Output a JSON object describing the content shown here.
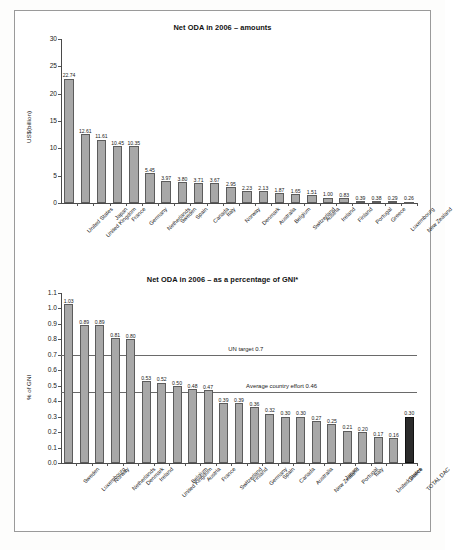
{
  "chart_data": [
    {
      "type": "bar",
      "title": "Net ODA in 2006 – amounts",
      "xlabel": "",
      "ylabel": "US$(billion)",
      "ylim": [
        0,
        30
      ],
      "yticks": [
        "0",
        "5",
        "10",
        "15",
        "20",
        "25",
        "30"
      ],
      "grid": false,
      "legend": "none",
      "categories": [
        "United States",
        "United Kingdom",
        "Japan",
        "France",
        "Germany",
        "Netherlands",
        "Sweden",
        "Spain",
        "Canada",
        "Italy",
        "Norway",
        "Denmark",
        "Australia",
        "Belgium",
        "Switzerland",
        "Austria",
        "Ireland",
        "Finland",
        "Portugal",
        "Greece",
        "Luxembourg",
        "New Zealand"
      ],
      "values": [
        22.74,
        12.61,
        11.61,
        10.45,
        10.35,
        5.45,
        3.97,
        3.8,
        3.71,
        3.67,
        2.95,
        2.23,
        2.13,
        1.87,
        1.65,
        1.51,
        1.0,
        0.83,
        0.39,
        0.38,
        0.29,
        0.26
      ],
      "value_labels": [
        "22.74",
        "12.61",
        "11.61",
        "10.45",
        "10.35",
        "5.45",
        "3.97",
        "3.80",
        "3.71",
        "3.67",
        "2.95",
        "2.23",
        "2.13",
        "1.87",
        "1.65",
        "1.51",
        "1.00",
        "0.83",
        "0.39",
        "0.38",
        "0.29",
        "0.26"
      ]
    },
    {
      "type": "bar",
      "title": "Net ODA in 2006 – as a percentage of GNI*",
      "xlabel": "",
      "ylabel": "% of GNI",
      "ylim": [
        0,
        1.1
      ],
      "yticks": [
        "0.0",
        "0.1",
        "0.2",
        "0.3",
        "0.4",
        "0.5",
        "0.6",
        "0.7",
        "0.8",
        "0.9",
        "1.0",
        "1.1"
      ],
      "grid": false,
      "legend": "none",
      "categories": [
        "Sweden",
        "Luxembourg",
        "Norway",
        "Netherlands",
        "Denmark",
        "Ireland",
        "United Kingdom",
        "Belgium",
        "Austria",
        "France",
        "Switzerland",
        "Finland",
        "Germany",
        "Spain",
        "Canada",
        "Australia",
        "New Zealand",
        "Japan",
        "Portugal",
        "Italy",
        "United States",
        "Greece",
        "TOTAL DAC"
      ],
      "values": [
        1.03,
        0.89,
        0.89,
        0.81,
        0.8,
        0.53,
        0.52,
        0.5,
        0.48,
        0.47,
        0.39,
        0.39,
        0.36,
        0.32,
        0.3,
        0.3,
        0.27,
        0.25,
        0.21,
        0.2,
        0.17,
        0.16,
        0.3
      ],
      "value_labels": [
        "1.03",
        "0.89",
        "0.89",
        "0.81",
        "0.80",
        "0.53",
        "0.52",
        "0.50",
        "0.48",
        "0.47",
        "0.39",
        "0.39",
        "0.36",
        "0.32",
        "0.30",
        "0.30",
        "0.27",
        "0.25",
        "0.21",
        "0.20",
        "0.17",
        "0.16",
        "0.30"
      ],
      "highlight_index": 22,
      "reference_lines": [
        {
          "value": 0.7,
          "label": "UN target 0.7"
        },
        {
          "value": 0.46,
          "label": "Average country effort 0.46"
        }
      ]
    }
  ]
}
